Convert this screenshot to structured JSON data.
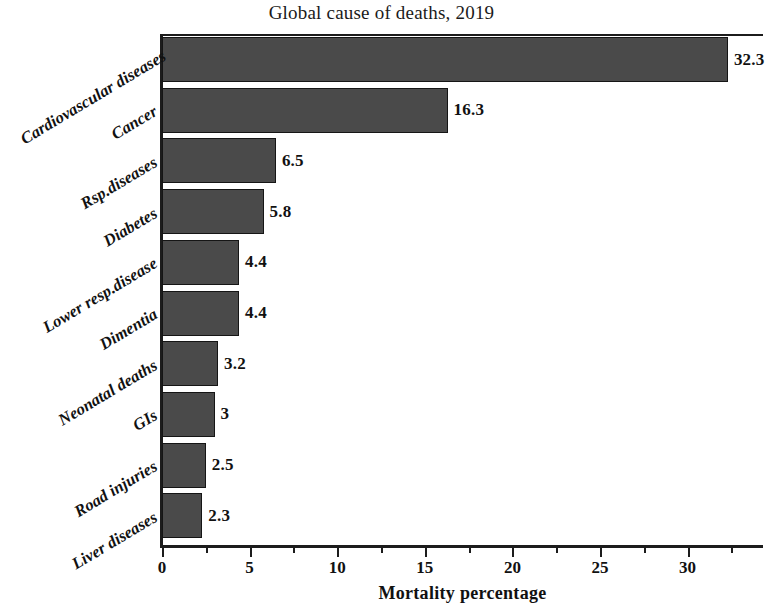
{
  "chart_data": {
    "type": "bar",
    "orientation": "horizontal",
    "title": "Global cause of deaths, 2019",
    "xlabel": "Mortality percentage",
    "ylabel": "",
    "xlim": [
      0,
      34.3
    ],
    "xticks": [
      0,
      5,
      10,
      15,
      20,
      25,
      30
    ],
    "xtick_labels": [
      "0",
      "5",
      "10",
      "15",
      "20",
      "25",
      "30"
    ],
    "minor_tick_step": 2.5,
    "grid": false,
    "legend": false,
    "bar_color": "#4a4a4a",
    "bar_edge_color": "#151515",
    "categories": [
      "Cardiovascular diseases",
      "Cancer",
      "Rsp.diseases",
      "Diabetes",
      "Lower resp.disease",
      "Dimentia",
      "Neonatal deaths",
      "GIs",
      "Road injuries",
      "Liver diseases"
    ],
    "values": [
      32.3,
      16.3,
      6.5,
      5.8,
      4.4,
      4.4,
      3.2,
      3,
      2.5,
      2.3
    ],
    "value_labels": [
      "32.3",
      "16.3",
      "6.5",
      "5.8",
      "4.4",
      "4.4",
      "3.2",
      "3",
      "2.5",
      "2.3"
    ]
  }
}
